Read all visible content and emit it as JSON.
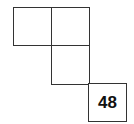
{
  "diagram": {
    "line_color": "#333333",
    "cells": [
      {
        "id": "r1c1",
        "row": 1,
        "col": 1,
        "label": ""
      },
      {
        "id": "r1c2",
        "row": 1,
        "col": 2,
        "label": ""
      },
      {
        "id": "r2c2",
        "row": 2,
        "col": 2,
        "label": ""
      },
      {
        "id": "r3c3",
        "row": 3,
        "col": 3,
        "label": "48"
      }
    ]
  }
}
